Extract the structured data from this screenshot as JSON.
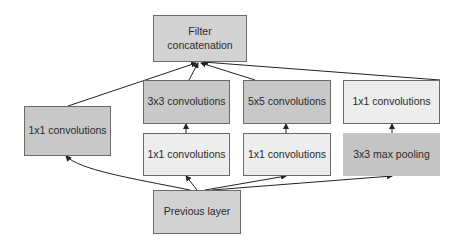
{
  "diagram": {
    "nodes": {
      "filter_concat": {
        "label_line1": "Filter",
        "label_line2": "concatenation",
        "fill": "#d2d2d2"
      },
      "conv1x1_direct": {
        "label": "1x1 convolutions",
        "fill": "#c8c8c8"
      },
      "conv3x3": {
        "label": "3x3 convolutions",
        "fill": "#c8c8c8"
      },
      "conv5x5": {
        "label": "5x5 convolutions",
        "fill": "#c8c8c8"
      },
      "conv1x1_after_pool": {
        "label": "1x1 convolutions",
        "fill": "#ededed"
      },
      "conv1x1_reduce_3x3": {
        "label": "1x1 convolutions",
        "fill": "#ededed"
      },
      "conv1x1_reduce_5x5": {
        "label": "1x1 convolutions",
        "fill": "#ededed"
      },
      "maxpool3x3": {
        "label": "3x3 max pooling",
        "fill": "#c4c4c4"
      },
      "previous_layer": {
        "label": "Previous layer",
        "fill": "#d2d2d2"
      }
    },
    "edges": [
      {
        "from": "previous_layer",
        "to": "conv1x1_direct"
      },
      {
        "from": "previous_layer",
        "to": "conv1x1_reduce_3x3"
      },
      {
        "from": "previous_layer",
        "to": "conv1x1_reduce_5x5"
      },
      {
        "from": "previous_layer",
        "to": "maxpool3x3"
      },
      {
        "from": "conv1x1_reduce_3x3",
        "to": "conv3x3"
      },
      {
        "from": "conv1x1_reduce_5x5",
        "to": "conv5x5"
      },
      {
        "from": "maxpool3x3",
        "to": "conv1x1_after_pool"
      },
      {
        "from": "conv1x1_direct",
        "to": "filter_concat"
      },
      {
        "from": "conv3x3",
        "to": "filter_concat"
      },
      {
        "from": "conv5x5",
        "to": "filter_concat"
      },
      {
        "from": "conv1x1_after_pool",
        "to": "filter_concat"
      }
    ]
  }
}
